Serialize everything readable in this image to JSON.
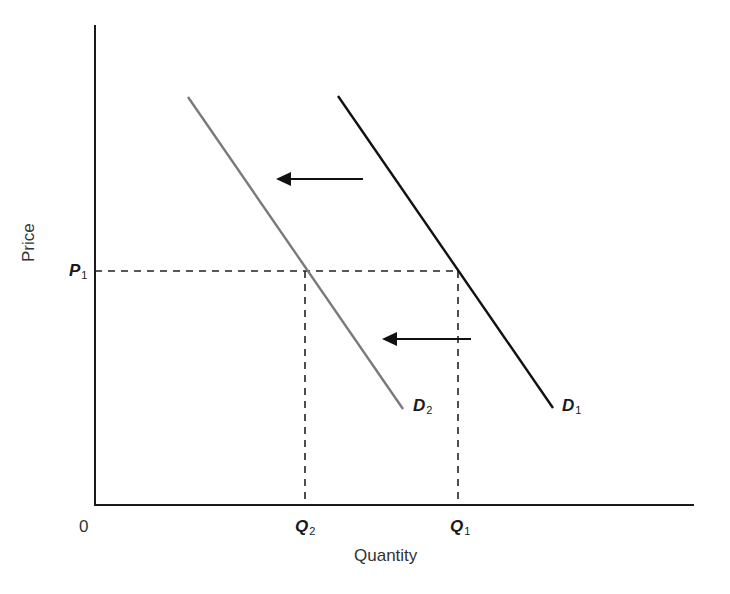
{
  "diagram": {
    "type": "supply-demand",
    "axes": {
      "x_label": "Quantity",
      "y_label": "Price",
      "origin_label": "0"
    },
    "labels": {
      "p1": {
        "main": "P",
        "sub": "1"
      },
      "q1": {
        "main": "Q",
        "sub": "1"
      },
      "q2": {
        "main": "Q",
        "sub": "2"
      },
      "d1": {
        "main": "D",
        "sub": "1"
      },
      "d2": {
        "main": "D",
        "sub": "2"
      }
    },
    "curves": [
      {
        "name": "D1",
        "color": "#111111",
        "from": [
          338,
          96
        ],
        "to": [
          553,
          408
        ]
      },
      {
        "name": "D2",
        "color": "#7a7a7a",
        "from": [
          188,
          97
        ],
        "to": [
          403,
          409
        ]
      }
    ],
    "arrows": [
      {
        "from": [
          363,
          179
        ],
        "to": [
          276,
          179
        ],
        "direction": "left"
      },
      {
        "from": [
          471,
          339
        ],
        "to": [
          382,
          339
        ],
        "direction": "left"
      }
    ],
    "guides": {
      "p1_y": 271,
      "q1_x": 458,
      "q2_x": 305
    },
    "colors": {
      "axis": "#1a1a1a",
      "d1": "#111111",
      "d2": "#7a7a7a",
      "dashed": "#222222"
    }
  }
}
